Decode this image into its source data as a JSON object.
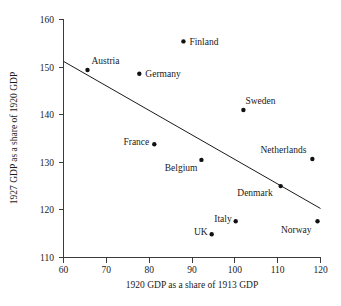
{
  "chart_data": {
    "type": "scatter",
    "title": "",
    "xlabel": "1920 GDP as a share of 1913 GDP",
    "ylabel": "1927 GDP as a share of 1920 GDP",
    "xlim": [
      60,
      120
    ],
    "ylim": [
      110,
      160
    ],
    "xticks": [
      60,
      70,
      80,
      90,
      100,
      110,
      120
    ],
    "yticks": [
      110,
      120,
      130,
      140,
      150,
      160
    ],
    "xtick_labels": [
      "60",
      "70",
      "80",
      "90",
      "100",
      "110",
      "120"
    ],
    "ytick_labels": [
      "110",
      "120",
      "130",
      "140",
      "150",
      "160"
    ],
    "grid": false,
    "legend": "none",
    "points": [
      {
        "label": "Finland",
        "x": 88.0,
        "y": 155.4,
        "label_dx": 6,
        "label_dy": 3.5,
        "anchor": "start"
      },
      {
        "label": "Austria",
        "x": 65.6,
        "y": 149.4,
        "label_dx": 4,
        "label_dy": -6,
        "anchor": "start"
      },
      {
        "label": "Germany",
        "x": 77.7,
        "y": 148.6,
        "label_dx": 6,
        "label_dy": 3.5,
        "anchor": "start"
      },
      {
        "label": "Sweden",
        "x": 102.0,
        "y": 141.0,
        "label_dx": 2,
        "label_dy": -6,
        "anchor": "start"
      },
      {
        "label": "France",
        "x": 81.2,
        "y": 133.8,
        "label_dx": -5,
        "label_dy": 0.5,
        "anchor": "end"
      },
      {
        "label": "Netherlands",
        "x": 118.1,
        "y": 130.7,
        "label_dx": -6,
        "label_dy": -6,
        "anchor": "end"
      },
      {
        "label": "Belgium",
        "x": 92.2,
        "y": 130.5,
        "label_dx": -4,
        "label_dy": 11,
        "anchor": "end"
      },
      {
        "label": "Denmark",
        "x": 110.7,
        "y": 125.0,
        "label_dx": -8,
        "label_dy": 10,
        "anchor": "end"
      },
      {
        "label": "Italy",
        "x": 100.2,
        "y": 117.6,
        "label_dx": -4,
        "label_dy": 1,
        "anchor": "end"
      },
      {
        "label": "Norway",
        "x": 119.3,
        "y": 117.6,
        "label_dx": -6,
        "label_dy": 12,
        "anchor": "end"
      },
      {
        "label": "UK",
        "x": 94.6,
        "y": 114.9,
        "label_dx": -4,
        "label_dy": 1,
        "anchor": "end"
      }
    ],
    "trend_line": {
      "x0": 60.0,
      "y0": 151.2,
      "x1": 120.0,
      "y1": 120.3
    },
    "colors": {
      "marker": "#111111",
      "axis": "#3b3b3b",
      "trend": "#1a1a1a",
      "text": "#1a1a1a",
      "background": "#ffffff"
    }
  }
}
